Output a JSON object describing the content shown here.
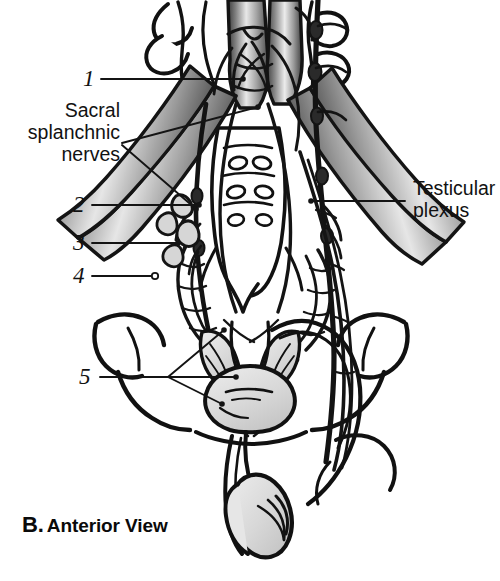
{
  "figure": {
    "caption_letter": "B.",
    "caption_text": "Anterior View",
    "labels": [
      {
        "id": "num-1",
        "text": "1",
        "kind": "number"
      },
      {
        "id": "num-2",
        "text": "2",
        "kind": "number"
      },
      {
        "id": "num-3",
        "text": "3",
        "kind": "number"
      },
      {
        "id": "num-4",
        "text": "4",
        "kind": "number"
      },
      {
        "id": "num-5",
        "text": "5",
        "kind": "number"
      }
    ],
    "text_labels": {
      "sacral_splanchnic": "Sacral\nsplanchnic\nnerves",
      "sacral_splanchnic_line1": "Sacral",
      "sacral_splanchnic_line2": "splanchnic",
      "sacral_splanchnic_line3": "nerves",
      "testicular_plexus_line1": "Testicular",
      "testicular_plexus_line2": "plexus"
    },
    "colors": {
      "ink": "#111111",
      "vessel_dark": "#4a4a4a",
      "vessel_mid": "#8d8d8d",
      "vessel_light": "#e4e4e4",
      "organ_fill": "#d9d9d9",
      "organ_fill_light": "#e9e9e9",
      "background": "#ffffff",
      "leader_line": "#151515"
    },
    "structures": [
      "lumbar vertebrae",
      "sacrum",
      "abdominal aorta",
      "inferior vena cava",
      "common iliac arteries",
      "common iliac veins",
      "sympathetic trunk with ganglia",
      "superior hypogastric plexus",
      "hypogastric nerves",
      "inferior hypogastric plexus",
      "sacral splanchnic nerves",
      "testicular plexus",
      "prostate",
      "seminal vesicles",
      "ductus deferens",
      "testis",
      "epididymis"
    ]
  }
}
